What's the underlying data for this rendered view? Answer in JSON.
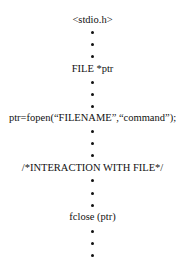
{
  "diagram": {
    "steps": [
      {
        "label": "<stdio.h>"
      },
      {
        "label": "FILE *ptr"
      },
      {
        "label": "ptr=fopen(“FILENAME”,“command”);"
      },
      {
        "label": "/*INTERACTION WITH FILE*/"
      },
      {
        "label": "fclose (ptr)"
      }
    ],
    "separator_glyph": "•",
    "dots_between_steps": 3,
    "trailing_dots": 3
  }
}
